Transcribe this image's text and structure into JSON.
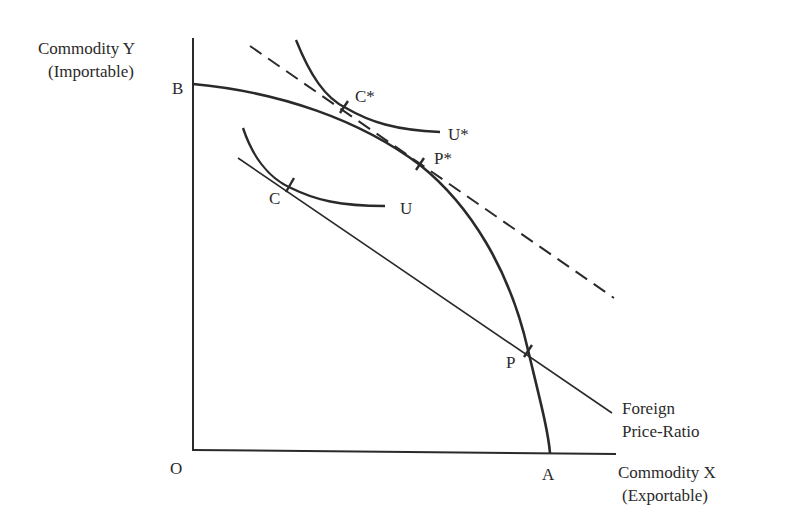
{
  "axes": {
    "y_label_line1": "Commodity  Y",
    "y_label_line2": "(Importable)",
    "x_label_line1": "Commodity  X",
    "x_label_line2": "(Exportable)",
    "origin": "O"
  },
  "points": {
    "B": "B",
    "A": "A",
    "C": "C",
    "C_star": "C*",
    "P": "P",
    "P_star": "P*"
  },
  "curves": {
    "U": "U",
    "U_star": "U*",
    "foreign_line1": "Foreign",
    "foreign_line2": "Price-Ratio"
  },
  "colors": {
    "ink": "#2a2a2a",
    "background": "#ffffff"
  }
}
